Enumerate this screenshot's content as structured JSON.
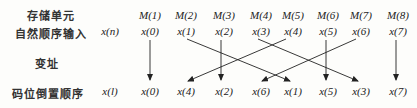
{
  "labels": {
    "storage_unit": "存储单元",
    "natural_order_input": "自然顺序输入",
    "address_change": "变址",
    "bit_reversed_order": "码位倒置顺序"
  },
  "row_symbols": {
    "input": "x(n)",
    "output": "x(l)"
  },
  "memory_cells": [
    "M(1)",
    "M(2)",
    "M(3)",
    "M(4)",
    "M(5)",
    "M(6)",
    "M(7)",
    "M(8)"
  ],
  "input_sequence": [
    "x(0)",
    "x(1)",
    "x(2)",
    "x(3)",
    "x(4)",
    "x(5)",
    "x(6)",
    "x(7)"
  ],
  "output_sequence": [
    "x(0)",
    "x(4)",
    "x(2)",
    "x(6)",
    "x(1)",
    "x(5)",
    "x(3)",
    "x(7)"
  ],
  "mapping": [
    [
      0,
      0
    ],
    [
      1,
      4
    ],
    [
      2,
      2
    ],
    [
      3,
      6
    ],
    [
      4,
      1
    ],
    [
      5,
      5
    ],
    [
      6,
      3
    ],
    [
      7,
      7
    ]
  ]
}
